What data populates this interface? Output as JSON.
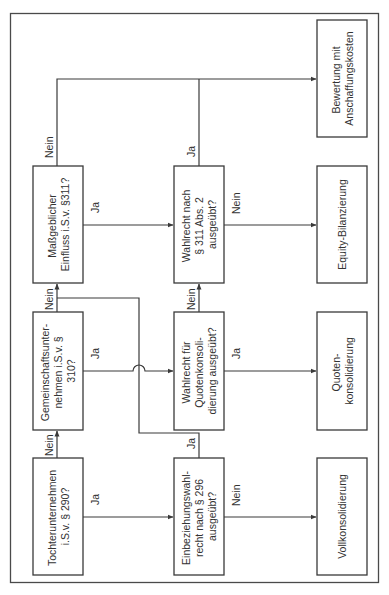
{
  "diagram": {
    "colors": {
      "stroke": "#3a3a3a",
      "text": "#333333",
      "background": "#ffffff"
    },
    "orientation": "rotated-90-ccw",
    "nodes": {
      "tochter": {
        "lines": [
          "Tochterunternehmen",
          "i.S.v. § 290?"
        ],
        "type": "decision"
      },
      "gemeinschaft": {
        "lines": [
          "Gemeinschaftsunter-",
          "nehmen i.S.v. §",
          "310?"
        ],
        "type": "decision"
      },
      "massgeblich": {
        "lines": [
          "Maßgeblicher",
          "Einfluss i.S.v. §311?"
        ],
        "type": "decision"
      },
      "einbeziehung": {
        "lines": [
          "Einbeziehungswahl-",
          "recht nach § 296",
          "ausgeübt?"
        ],
        "type": "decision"
      },
      "quotenwahl": {
        "lines": [
          "Wahlrecht für",
          "Quotenkonsoli-",
          "dierung ausgeübt?"
        ],
        "type": "decision"
      },
      "wahl311": {
        "lines": [
          "Wahlrecht nach",
          "§ 311 Abs. 2",
          "ausgeübt?"
        ],
        "type": "decision"
      },
      "vollkons": {
        "lines": [
          "Vollkonsolidierung"
        ],
        "type": "result"
      },
      "quotenkons": {
        "lines": [
          "Quoten-",
          "konsolidierung"
        ],
        "type": "result"
      },
      "equity": {
        "lines": [
          "Equity-Bilanzierung"
        ],
        "type": "result"
      },
      "bewertung": {
        "lines": [
          "Bewertung mit",
          "Anschaffungskosten"
        ],
        "type": "result"
      }
    },
    "edge_labels": {
      "tochter_ja": "Ja",
      "tochter_nein": "Nein",
      "gemeinschaft_ja": "Ja",
      "gemeinschaft_nein": "Nein",
      "massgeblich_ja": "Ja",
      "massgeblich_nein": "Nein",
      "einbeziehung_ja": "Ja",
      "einbeziehung_nein": "Nein",
      "quotenwahl_ja": "Ja",
      "quotenwahl_nein": "Nein",
      "wahl311_ja": "Ja",
      "wahl311_nein": "Nein"
    },
    "edges": [
      {
        "from": "tochter",
        "to": "einbeziehung",
        "label": "Ja"
      },
      {
        "from": "tochter",
        "to": "gemeinschaft",
        "label": "Nein"
      },
      {
        "from": "einbeziehung",
        "to": "vollkons",
        "label": "Nein"
      },
      {
        "from": "einbeziehung",
        "to": "massgeblich",
        "label": "Ja"
      },
      {
        "from": "gemeinschaft",
        "to": "quotenwahl",
        "label": "Ja"
      },
      {
        "from": "gemeinschaft",
        "to": "massgeblich",
        "label": "Nein"
      },
      {
        "from": "quotenwahl",
        "to": "quotenkons",
        "label": "Ja"
      },
      {
        "from": "quotenwahl",
        "to": "wahl311",
        "label": "Nein"
      },
      {
        "from": "massgeblich",
        "to": "wahl311",
        "label": "Ja"
      },
      {
        "from": "massgeblich",
        "to": "bewertung",
        "label": "Nein"
      },
      {
        "from": "wahl311",
        "to": "equity",
        "label": "Nein"
      },
      {
        "from": "wahl311",
        "to": "bewertung",
        "label": "Ja"
      }
    ]
  }
}
